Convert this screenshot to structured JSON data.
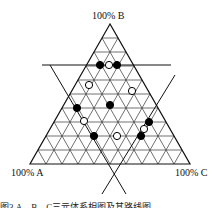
{
  "diagram": {
    "type": "ternary",
    "vertices": {
      "top": {
        "label": "100% B"
      },
      "left": {
        "label": "100% A"
      },
      "right": {
        "label": "100% C"
      }
    },
    "grid_divisions": 10,
    "points": [
      {
        "style": "filled",
        "x": 100,
        "y": 65
      },
      {
        "style": "open",
        "x": 109,
        "y": 65
      },
      {
        "style": "filled",
        "x": 117,
        "y": 65
      },
      {
        "style": "open",
        "x": 89,
        "y": 85
      },
      {
        "style": "open",
        "x": 132,
        "y": 91
      },
      {
        "style": "filled",
        "x": 77,
        "y": 108
      },
      {
        "style": "filled",
        "x": 110,
        "y": 105
      },
      {
        "style": "open",
        "x": 84,
        "y": 121
      },
      {
        "style": "filled",
        "x": 149,
        "y": 122
      },
      {
        "style": "open",
        "x": 144,
        "y": 129
      },
      {
        "style": "filled",
        "x": 94,
        "y": 136
      },
      {
        "style": "open",
        "x": 117,
        "y": 136
      },
      {
        "style": "filled",
        "x": 141,
        "y": 136
      }
    ],
    "colors": {
      "line": "#111111",
      "grid": "#333333",
      "fill": "#000000",
      "open_fill": "#ffffff"
    }
  },
  "caption": "图3 A、B、C三元体系相图及其路线图"
}
